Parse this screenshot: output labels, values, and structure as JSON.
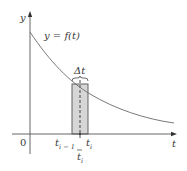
{
  "diagram": {
    "y_axis_label": "y",
    "x_axis_label": "t",
    "origin_label": "0",
    "curve_label": "y = f(t)",
    "delta_label": "Δt",
    "left_endpoint_base": "t",
    "left_endpoint_sub": "i − 1",
    "right_endpoint_base": "t",
    "right_endpoint_sub": "i",
    "sample_point_base": "t",
    "sample_point_sub": "i",
    "colors": {
      "axis": "#555555",
      "curve": "#6a6a6a",
      "rect_fill": "#d6d6d6",
      "rect_stroke": "#555555",
      "text": "#3a3a3a"
    }
  }
}
